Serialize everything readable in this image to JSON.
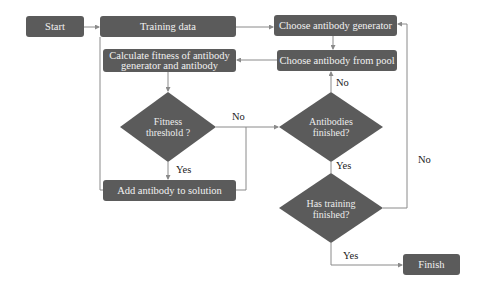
{
  "diagram": {
    "type": "flowchart",
    "colors": {
      "node_fill": "#5b5b5b",
      "node_text": "#f2f2f2",
      "edge": "#8a8a8a",
      "label_text": "#222222"
    },
    "nodes": {
      "start": "Start",
      "training_data": "Training data",
      "calc_fitness": "Calculate fitness of antibody generator and antibody",
      "fitness_threshold": "Fitness threshold ?",
      "add_antibody": "Add antibody to solution",
      "choose_generator": "Choose antibody generator",
      "choose_from_pool": "Choose antibody from pool",
      "antibodies_finished": "Antibodies finished?",
      "training_finished": "Has training finished?",
      "finish": "Finish"
    },
    "edge_labels": {
      "fitness_no": "No",
      "fitness_yes": "Yes",
      "antibodies_no": "No",
      "antibodies_yes": "Yes",
      "training_no": "No",
      "training_yes": "Yes"
    },
    "edges": [
      [
        "Start",
        "Training data",
        ""
      ],
      [
        "Training data",
        "Choose antibody generator",
        ""
      ],
      [
        "Choose antibody generator",
        "Choose antibody from pool",
        ""
      ],
      [
        "Choose antibody from pool",
        "Calculate fitness of antibody generator and antibody",
        ""
      ],
      [
        "Calculate fitness of antibody generator and antibody",
        "Fitness threshold ?",
        ""
      ],
      [
        "Fitness threshold ?",
        "Add antibody to solution",
        "Yes"
      ],
      [
        "Fitness threshold ?",
        "Antibodies finished?",
        "No"
      ],
      [
        "Add antibody to solution",
        "Antibodies finished?",
        ""
      ],
      [
        "Antibodies finished?",
        "Choose antibody from pool",
        "No"
      ],
      [
        "Antibodies finished?",
        "Has training finished?",
        "Yes"
      ],
      [
        "Has training finished?",
        "Choose antibody generator",
        "No"
      ],
      [
        "Has training finished?",
        "Finish",
        "Yes"
      ],
      [
        "Add antibody to solution",
        "Training data",
        "loop (left line)"
      ]
    ]
  }
}
